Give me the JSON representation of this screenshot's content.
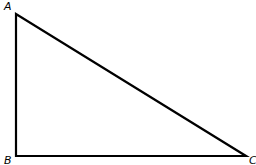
{
  "diagram": {
    "type": "right triangle",
    "stroke_color": "#000000",
    "vertices": [
      {
        "label": "A",
        "x": 16,
        "y": 14
      },
      {
        "label": "B",
        "x": 16,
        "y": 156
      },
      {
        "label": "C",
        "x": 246,
        "y": 156
      }
    ],
    "right_angle_at": "B"
  }
}
